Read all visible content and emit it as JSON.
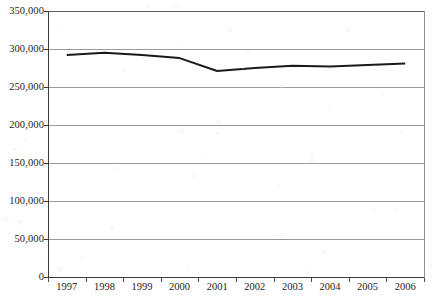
{
  "chart_data": {
    "type": "line",
    "title": "",
    "xlabel": "",
    "ylabel": "",
    "categories": [
      "1997",
      "1998",
      "1999",
      "2000",
      "2001",
      "2002",
      "2003",
      "2004",
      "2005",
      "2006"
    ],
    "series": [
      {
        "name": "Total",
        "values": [
          292000,
          295000,
          292000,
          288000,
          271000,
          275000,
          278000,
          277000,
          279000,
          281000
        ],
        "color": "#1a1a1a"
      }
    ],
    "ylim": [
      0,
      350000
    ],
    "yticks": [
      0,
      50000,
      100000,
      150000,
      200000,
      250000,
      300000,
      350000
    ],
    "ytick_labels": [
      "0",
      "50,000",
      "100,000",
      "150,000",
      "200,000",
      "250,000",
      "300,000",
      "350,000"
    ],
    "xtick_labels": [
      "1997",
      "1998",
      "1999",
      "2000",
      "2001",
      "2002",
      "2003",
      "2004",
      "2005",
      "2006"
    ],
    "grid": true,
    "grid_axis": "y",
    "grid_color": "#9a9a9a",
    "legend": false,
    "legend_position": "none",
    "background": "#ffffff",
    "axis_color": "#3b3b3b",
    "line_width": 2
  },
  "axes": {
    "y_axis_name": "value-axis",
    "x_axis_name": "year-axis"
  }
}
